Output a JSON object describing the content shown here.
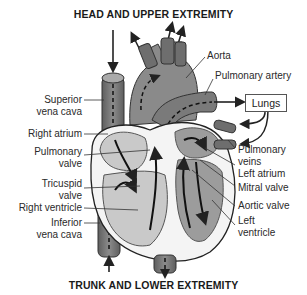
{
  "diagram": {
    "title_top": "HEAD AND UPPER EXTREMITY",
    "title_bottom": "TRUNK AND LOWER EXTREMITY",
    "box": {
      "label": "Lungs"
    },
    "labels_left": [
      {
        "line1": "Superior",
        "line2": "vena cava"
      },
      {
        "line1": "Right atrium",
        "line2": ""
      },
      {
        "line1": "Pulmonary",
        "line2": "valve"
      },
      {
        "line1": "Tricuspid",
        "line2": "valve"
      },
      {
        "line1": "Right ventricle",
        "line2": ""
      },
      {
        "line1": "Inferior",
        "line2": "vena cava"
      }
    ],
    "labels_right": [
      {
        "line1": "Aorta",
        "line2": ""
      },
      {
        "line1": "Pulmonary artery",
        "line2": ""
      },
      {
        "line1": "Pulmonary",
        "line2": "veins"
      },
      {
        "line1": "Left atrium",
        "line2": ""
      },
      {
        "line1": "Mitral valve",
        "line2": ""
      },
      {
        "line1": "Aortic valve",
        "line2": ""
      },
      {
        "line1": "Left",
        "line2": "ventricle"
      }
    ],
    "colors": {
      "dark_vessel": "#6e6e6e",
      "mid_gray": "#9a9a9a",
      "light_gray": "#d4d4d4",
      "wall": "#e8e8e8",
      "line": "#222222"
    }
  }
}
